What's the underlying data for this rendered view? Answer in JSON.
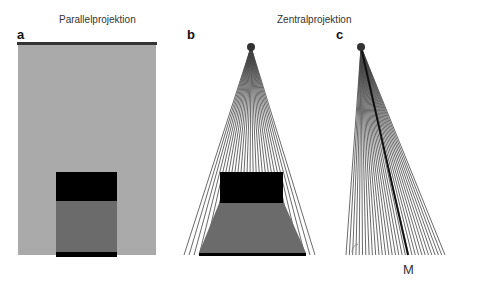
{
  "titles": {
    "parallel": "Parallelprojektion",
    "central": "Zentralprojektion"
  },
  "panels": [
    {
      "id": "a",
      "label": "a",
      "type": "parallel"
    },
    {
      "id": "b",
      "label": "b",
      "type": "central"
    },
    {
      "id": "c",
      "label": "c",
      "type": "central-oblique"
    }
  ],
  "labels": {
    "m": "M"
  },
  "colors": {
    "line": "#444444",
    "dark_line": "#111111",
    "object_black": "#000000",
    "object_gray": "#6b6b6b",
    "background": "#ffffff"
  },
  "caption": ""
}
